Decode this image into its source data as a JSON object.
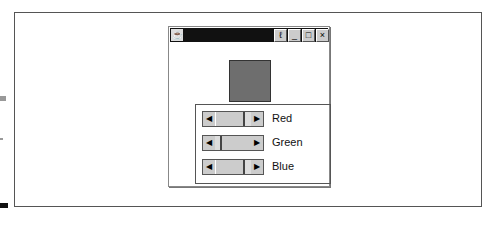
{
  "window": {
    "buttons": {
      "minimize": "_",
      "maximize": "□",
      "close": "×"
    },
    "swatch_color": "#6e6e6e"
  },
  "sliders": [
    {
      "label": "Red",
      "thumb_left": 12,
      "thumb_width": 30
    },
    {
      "label": "Green",
      "thumb_left": 17,
      "thumb_width": 32
    },
    {
      "label": "Blue",
      "thumb_left": 12,
      "thumb_width": 30
    }
  ]
}
